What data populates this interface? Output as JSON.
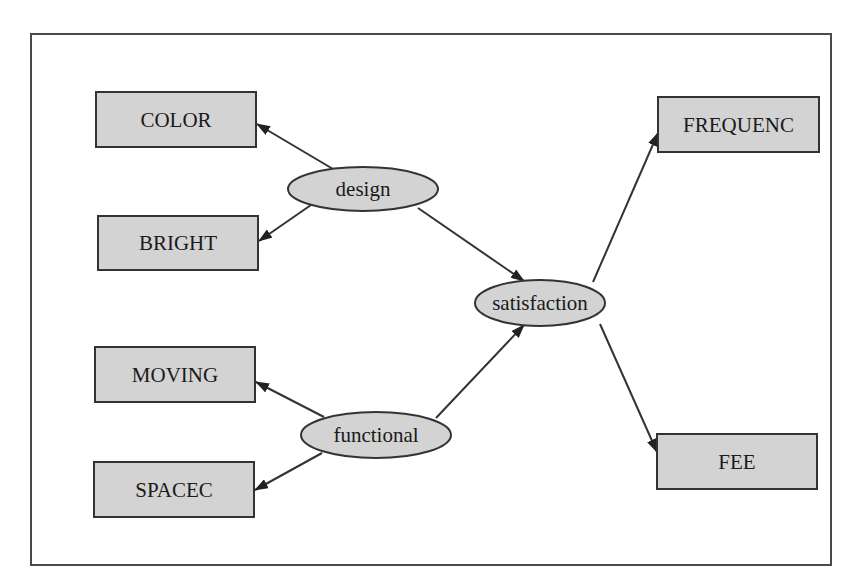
{
  "diagram": {
    "type": "path-diagram",
    "style": {
      "node_fill": "#d3d3d3",
      "node_stroke": "#333333",
      "edge_color": "#333333",
      "frame_color": "#4a4a4a",
      "background": "#ffffff"
    },
    "latent_nodes": [
      {
        "id": "design",
        "label": "design",
        "shape": "ellipse",
        "cx": 363,
        "cy": 189,
        "rx": 75,
        "ry": 22
      },
      {
        "id": "satisfaction",
        "label": "satisfaction",
        "shape": "ellipse",
        "cx": 540,
        "cy": 303,
        "rx": 65,
        "ry": 23
      },
      {
        "id": "functional",
        "label": "functional",
        "shape": "ellipse",
        "cx": 376,
        "cy": 435,
        "rx": 75,
        "ry": 23
      }
    ],
    "observed_nodes": [
      {
        "id": "COLOR",
        "label": "COLOR",
        "shape": "rect",
        "x": 96,
        "y": 92,
        "w": 160,
        "h": 55
      },
      {
        "id": "BRIGHT",
        "label": "BRIGHT",
        "shape": "rect",
        "x": 98,
        "y": 216,
        "w": 160,
        "h": 54
      },
      {
        "id": "MOVING",
        "label": "MOVING",
        "shape": "rect",
        "x": 95,
        "y": 347,
        "w": 160,
        "h": 55
      },
      {
        "id": "SPACEC",
        "label": "SPACEC",
        "shape": "rect",
        "x": 94,
        "y": 462,
        "w": 160,
        "h": 55
      },
      {
        "id": "FREQUENC",
        "label": "FREQUENC",
        "shape": "rect",
        "x": 658,
        "y": 97,
        "w": 161,
        "h": 55
      },
      {
        "id": "FEE",
        "label": "FEE",
        "shape": "rect",
        "x": 657,
        "y": 434,
        "w": 160,
        "h": 55
      }
    ],
    "edges": [
      {
        "from": "design",
        "to": "COLOR",
        "x1": 333,
        "y1": 169,
        "x2": 257,
        "y2": 124
      },
      {
        "from": "design",
        "to": "BRIGHT",
        "x1": 311,
        "y1": 205,
        "x2": 259,
        "y2": 241
      },
      {
        "from": "design",
        "to": "satisfaction",
        "x1": 418,
        "y1": 208,
        "x2": 524,
        "y2": 281
      },
      {
        "from": "functional",
        "to": "MOVING",
        "x1": 324,
        "y1": 417,
        "x2": 256,
        "y2": 382
      },
      {
        "from": "functional",
        "to": "SPACEC",
        "x1": 322,
        "y1": 453,
        "x2": 255,
        "y2": 490
      },
      {
        "from": "functional",
        "to": "satisfaction",
        "x1": 436,
        "y1": 418,
        "x2": 524,
        "y2": 325
      },
      {
        "from": "satisfaction",
        "to": "FREQUENC",
        "x1": 593,
        "y1": 282,
        "x2": 658,
        "y2": 133
      },
      {
        "from": "satisfaction",
        "to": "FEE",
        "x1": 600,
        "y1": 324,
        "x2": 657,
        "y2": 452
      }
    ]
  }
}
